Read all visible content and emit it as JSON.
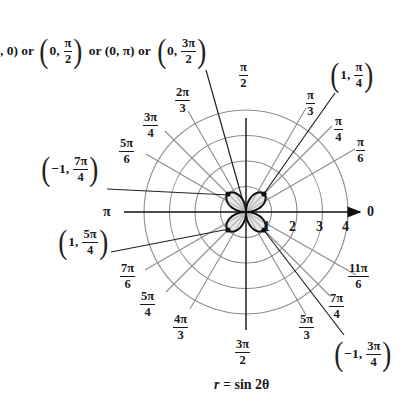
{
  "figure": {
    "caption": {
      "lhs": "r",
      "eq": "=",
      "rhs": "sin 2θ"
    },
    "top_annotation": {
      "prefix": ", 0) or",
      "point2": {
        "r": "0,",
        "num": "π",
        "den": "2"
      },
      "mid": "or (0, π) or",
      "point4": {
        "r": "0,",
        "num": "3π",
        "den": "2"
      }
    },
    "point_labels": [
      {
        "id": "p1",
        "r": "1,",
        "num": "π",
        "den": "4"
      },
      {
        "id": "p2",
        "r": "−1,",
        "num": "7π",
        "den": "4"
      },
      {
        "id": "p3",
        "r": "1,",
        "num": "5π",
        "den": "4"
      },
      {
        "id": "p4",
        "r": "−1,",
        "num": "3π",
        "den": "4"
      }
    ],
    "angle_labels": {
      "zero": "0",
      "pi": "π",
      "pi_6": {
        "num": "π",
        "den": "6"
      },
      "pi_4": {
        "num": "π",
        "den": "4"
      },
      "pi_3": {
        "num": "π",
        "den": "3"
      },
      "pi_2": {
        "num": "π",
        "den": "2"
      },
      "2pi_3": {
        "num": "2π",
        "den": "3"
      },
      "3pi_4": {
        "num": "3π",
        "den": "4"
      },
      "5pi_6": {
        "num": "5π",
        "den": "6"
      },
      "7pi_6": {
        "num": "7π",
        "den": "6"
      },
      "5pi_4": {
        "num": "5π",
        "den": "4"
      },
      "4pi_3": {
        "num": "4π",
        "den": "3"
      },
      "3pi_2": {
        "num": "3π",
        "den": "2"
      },
      "5pi_3": {
        "num": "5π",
        "den": "3"
      },
      "7pi_4": {
        "num": "7π",
        "den": "4"
      },
      "11pi_6": {
        "num": "11π",
        "den": "6"
      }
    },
    "radial_ticks": [
      "1",
      "2",
      "3",
      "4"
    ]
  },
  "chart_data": {
    "type": "polar",
    "title": "r = sin 2θ",
    "equation": "r = sin(2θ)",
    "curve": "four-petaled rose",
    "rmax": 1,
    "grid": {
      "circles": [
        1,
        2,
        3,
        4
      ],
      "rays_deg": [
        0,
        30,
        45,
        60,
        90,
        120,
        135,
        150,
        180,
        210,
        225,
        240,
        270,
        300,
        315,
        330
      ]
    },
    "highlighted_points": [
      {
        "label": "(1, π/4)",
        "r": 1,
        "theta": "π/4"
      },
      {
        "label": "(−1, 7π/4)",
        "r": -1,
        "theta": "7π/4"
      },
      {
        "label": "(1, 5π/4)",
        "r": 1,
        "theta": "5π/4"
      },
      {
        "label": "(−1, 3π/4)",
        "r": -1,
        "theta": "3π/4"
      }
    ],
    "zeros": [
      "(0, 0)",
      "(0, π/2)",
      "(0, π)",
      "(0, 3π/2)"
    ],
    "colors": {
      "curve": "#111111",
      "grid": "#8a8a8a",
      "axes": "#111111"
    }
  }
}
